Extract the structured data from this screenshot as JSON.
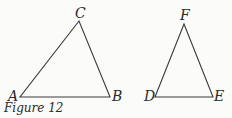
{
  "caption": "Figure 12",
  "triangles": [
    {
      "name": "ABC",
      "vertices": {
        "A": [
          20,
          97
        ],
        "B": [
          110,
          97
        ],
        "C": [
          79,
          21
        ]
      }
    },
    {
      "name": "DEF",
      "vertices": {
        "D": [
          155,
          97
        ],
        "E": [
          213,
          97
        ],
        "F": [
          184,
          24
        ]
      }
    }
  ],
  "labels": {
    "A": "A",
    "B": "B",
    "C": "C",
    "D": "D",
    "E": "E",
    "F": "F"
  },
  "colors": {
    "stroke": "#3a3a3a",
    "text": "#2a2a2a"
  }
}
